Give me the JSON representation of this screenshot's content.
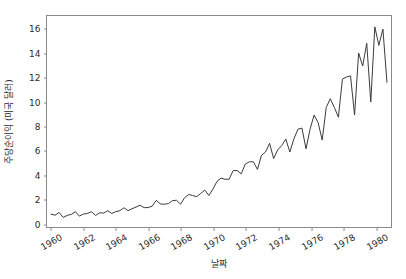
{
  "figure": {
    "background_color": "#ffffff",
    "line_color": "#3b3b3b",
    "axis_color": "#8a8a8a",
    "tick_text_color": "#2b2b2b"
  },
  "chart_data": {
    "type": "line",
    "title": "",
    "xlabel": "날짜",
    "ylabel": "주당순이익 (미국 달러)",
    "xlim": [
      1959.75,
      1981.0
    ],
    "ylim": [
      -0.35,
      17.1
    ],
    "grid": false,
    "legend": null,
    "xticks": [
      1960,
      1962,
      1964,
      1966,
      1968,
      1970,
      1972,
      1974,
      1976,
      1978,
      1980
    ],
    "xticklabels": [
      "1960",
      "1962",
      "1964",
      "1966",
      "1968",
      "1970",
      "1972",
      "1974",
      "1976",
      "1978",
      "1980"
    ],
    "yticks": [
      0,
      2,
      4,
      6,
      8,
      10,
      12,
      14,
      16
    ],
    "yticklabels": [
      "0",
      "2",
      "4",
      "6",
      "8",
      "10",
      "12",
      "14",
      "16"
    ],
    "series": [
      {
        "name": "주당순이익",
        "x": [
          1960.0,
          1960.25,
          1960.5,
          1960.75,
          1961.0,
          1961.25,
          1961.5,
          1961.75,
          1962.0,
          1962.25,
          1962.5,
          1962.75,
          1963.0,
          1963.25,
          1963.5,
          1963.75,
          1964.0,
          1964.25,
          1964.5,
          1964.75,
          1965.0,
          1965.25,
          1965.5,
          1965.75,
          1966.0,
          1966.25,
          1966.5,
          1966.75,
          1967.0,
          1967.25,
          1967.5,
          1967.75,
          1968.0,
          1968.25,
          1968.5,
          1968.75,
          1969.0,
          1969.25,
          1969.5,
          1969.75,
          1970.0,
          1970.25,
          1970.5,
          1970.75,
          1971.0,
          1971.25,
          1971.5,
          1971.75,
          1972.0,
          1972.25,
          1972.5,
          1972.75,
          1973.0,
          1973.25,
          1973.5,
          1973.75,
          1974.0,
          1974.25,
          1974.5,
          1974.75,
          1975.0,
          1975.25,
          1975.5,
          1975.75,
          1976.0,
          1976.25,
          1976.5,
          1976.75,
          1977.0,
          1977.25,
          1977.5,
          1977.75,
          1978.0,
          1978.25,
          1978.5,
          1978.75,
          1979.0,
          1979.25,
          1979.5,
          1979.75,
          1980.0,
          1980.25,
          1980.5,
          1980.75
        ],
        "values": [
          0.71,
          0.63,
          0.85,
          0.44,
          0.61,
          0.69,
          0.92,
          0.55,
          0.72,
          0.77,
          0.92,
          0.6,
          0.83,
          0.8,
          1.0,
          0.77,
          0.92,
          1.0,
          1.24,
          1.0,
          1.16,
          1.3,
          1.45,
          1.25,
          1.26,
          1.38,
          1.86,
          1.56,
          1.53,
          1.59,
          1.83,
          1.86,
          1.53,
          2.07,
          2.34,
          2.25,
          2.16,
          2.43,
          2.7,
          2.25,
          2.79,
          3.42,
          3.69,
          3.6,
          3.6,
          4.32,
          4.32,
          4.05,
          4.86,
          5.04,
          5.04,
          4.41,
          5.58,
          5.85,
          6.57,
          5.31,
          6.03,
          6.39,
          6.93,
          5.85,
          6.93,
          7.74,
          7.83,
          6.12,
          7.74,
          8.91,
          8.28,
          6.84,
          9.54,
          10.26,
          9.54,
          8.73,
          11.88,
          12.06,
          12.15,
          8.91,
          14.04,
          12.96,
          14.85,
          9.99,
          16.2,
          14.67,
          16.02,
          11.61
        ]
      }
    ]
  },
  "axis_titles": {
    "x": "날짜",
    "y": "주당순이익 (미국 달러)"
  }
}
